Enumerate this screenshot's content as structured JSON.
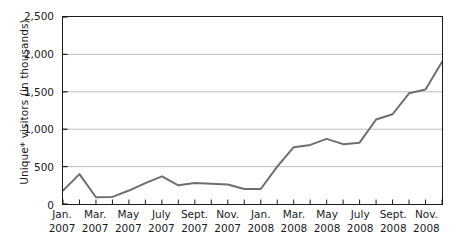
{
  "chart_data": {
    "type": "line",
    "title": "",
    "xlabel": "",
    "ylabel": "Unique* visitors (in thousands)",
    "ylim": [
      0,
      2500
    ],
    "yticks": [
      0,
      500,
      1000,
      1500,
      2000,
      2500
    ],
    "ytick_labels": [
      "0",
      "500",
      "1,000",
      "1,500",
      "2,000",
      "2,500"
    ],
    "grid": true,
    "legend": "none",
    "x": [
      "Jan. 2007",
      "Feb. 2007",
      "Mar. 2007",
      "Apr. 2007",
      "May 2007",
      "June 2007",
      "July 2007",
      "Aug. 2007",
      "Sept. 2007",
      "Oct. 2007",
      "Nov. 2007",
      "Dec. 2007",
      "Jan. 2008",
      "Feb. 2008",
      "Mar. 2008",
      "Apr. 2008",
      "May 2008",
      "June 2008",
      "July 2008",
      "Aug. 2008",
      "Sept. 2008",
      "Oct. 2008",
      "Nov. 2008",
      "Dec. 2008"
    ],
    "xtick_labels": [
      {
        "month": "Jan.",
        "year": "2007"
      },
      {
        "month": "Mar.",
        "year": "2007"
      },
      {
        "month": "May",
        "year": "2007"
      },
      {
        "month": "July",
        "year": "2007"
      },
      {
        "month": "Sept.",
        "year": "2007"
      },
      {
        "month": "Nov.",
        "year": "2007"
      },
      {
        "month": "Jan.",
        "year": "2008"
      },
      {
        "month": "Mar.",
        "year": "2008"
      },
      {
        "month": "May",
        "year": "2008"
      },
      {
        "month": "July",
        "year": "2008"
      },
      {
        "month": "Sept.",
        "year": "2008"
      },
      {
        "month": "Nov.",
        "year": "2008"
      }
    ],
    "values": [
      180,
      400,
      90,
      95,
      180,
      280,
      370,
      250,
      280,
      270,
      260,
      200,
      200,
      500,
      760,
      790,
      870,
      800,
      820,
      1130,
      1200,
      1480,
      1530,
      1900
    ],
    "series": [
      {
        "name": "Unique visitors",
        "color": "#6e6e6e",
        "values": [
          180,
          400,
          90,
          95,
          180,
          280,
          370,
          250,
          280,
          270,
          260,
          200,
          200,
          500,
          760,
          790,
          870,
          800,
          820,
          1130,
          1200,
          1480,
          1530,
          1900
        ]
      }
    ],
    "colors": {
      "line": "#6e6e6e",
      "axis": "#1a1a1a",
      "grid": "#bdbdbd",
      "background": "#ffffff",
      "text": "#1a1a1a"
    }
  }
}
